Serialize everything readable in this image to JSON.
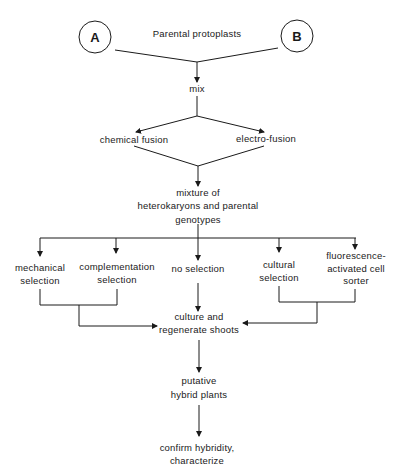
{
  "diagram": {
    "type": "flowchart",
    "colors": {
      "line": "#1a1a1a",
      "background": "#ffffff"
    },
    "parents": {
      "title": "Parental protoplasts",
      "a_label": "A",
      "b_label": "B"
    },
    "mix": "mix",
    "fusion": {
      "chemical": "chemical fusion",
      "electro": "electro-fusion"
    },
    "mixture": {
      "line1": "mixture of",
      "line2": "heterokaryons and parental",
      "line3": "genotypes"
    },
    "selection": {
      "mechanical": {
        "line1": "mechanical",
        "line2": "selection"
      },
      "complementation": {
        "line1": "complementation",
        "line2": "selection"
      },
      "none": {
        "line1": "no selection"
      },
      "cultural": {
        "line1": "cultural",
        "line2": "selection"
      },
      "facs": {
        "line1": "fluorescence-",
        "line2": "activated cell",
        "line3": "sorter"
      }
    },
    "culture": {
      "line1": "culture and",
      "line2": "regenerate shoots"
    },
    "putative": {
      "line1": "putative",
      "line2": "hybrid plants"
    },
    "confirm": {
      "line1": "confirm hybridity,",
      "line2": "characterize"
    }
  }
}
